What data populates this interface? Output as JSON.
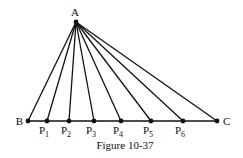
{
  "figure": {
    "caption": "Figure 10-37",
    "apex": {
      "label": "A",
      "x": 76,
      "y": 22
    },
    "baseline_y": 121,
    "points": [
      {
        "label": "B",
        "sub": "",
        "x": 28
      },
      {
        "label": "P",
        "sub": "1",
        "x": 47
      },
      {
        "label": "P",
        "sub": "2",
        "x": 69
      },
      {
        "label": "P",
        "sub": "3",
        "x": 94
      },
      {
        "label": "P",
        "sub": "4",
        "x": 121
      },
      {
        "label": "P",
        "sub": "5",
        "x": 151
      },
      {
        "label": "P",
        "sub": "6",
        "x": 183
      },
      {
        "label": "C",
        "sub": "",
        "x": 217
      }
    ],
    "line_color": "#111111"
  }
}
